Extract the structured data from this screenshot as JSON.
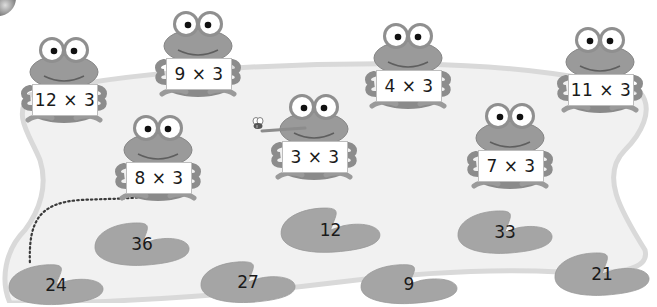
{
  "scene": {
    "description": "Frogs holding multiplication cards (times 3) above a pond with answer lily pads",
    "colors": {
      "frog_body": "#9a9a9a",
      "frog_dark": "#7e7e7e",
      "pond_fill": "#f1f1f1",
      "pond_edge": "#d9d9d9",
      "pad_fill": "#a5a5a5",
      "text": "#1a1a1a"
    }
  },
  "frogs": [
    {
      "label": "12 × 3",
      "x": 18,
      "y": 28
    },
    {
      "label": "9 × 3",
      "x": 152,
      "y": 2
    },
    {
      "label": "8 × 3",
      "x": 112,
      "y": 106
    },
    {
      "label": "3 × 3",
      "x": 268,
      "y": 85
    },
    {
      "label": "4 × 3",
      "x": 362,
      "y": 14
    },
    {
      "label": "7 × 3",
      "x": 464,
      "y": 94
    },
    {
      "label": "11 × 3",
      "x": 554,
      "y": 18
    }
  ],
  "lily_pads": [
    {
      "value": "36",
      "x": 92,
      "y": 220,
      "w": 100,
      "h": 48
    },
    {
      "value": "12",
      "x": 278,
      "y": 205,
      "w": 105,
      "h": 50
    },
    {
      "value": "33",
      "x": 455,
      "y": 208,
      "w": 100,
      "h": 48
    },
    {
      "value": "24",
      "x": 6,
      "y": 262,
      "w": 100,
      "h": 45
    },
    {
      "value": "27",
      "x": 198,
      "y": 259,
      "w": 100,
      "h": 46
    },
    {
      "value": "9",
      "x": 358,
      "y": 262,
      "w": 102,
      "h": 44
    },
    {
      "value": "21",
      "x": 552,
      "y": 250,
      "w": 100,
      "h": 48
    }
  ],
  "connection": {
    "from": "8 × 3",
    "to": "24",
    "style": "dotted"
  },
  "fly": {
    "near": "3 × 3"
  }
}
